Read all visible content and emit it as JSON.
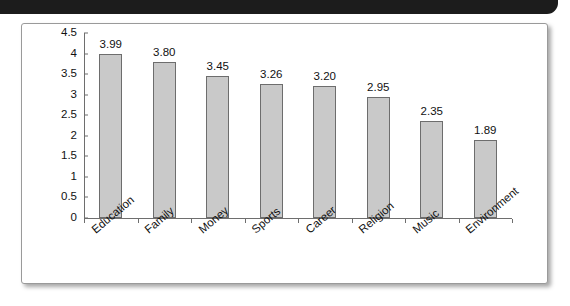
{
  "banner": {
    "name": "top-black-banner"
  },
  "chart_data": {
    "type": "bar",
    "title": "",
    "subtitle": "",
    "xlabel": "",
    "ylabel": "",
    "categories": [
      "Education",
      "Family",
      "Money",
      "Sports",
      "Career",
      "Religion",
      "Music",
      "Environment"
    ],
    "values": [
      3.99,
      3.8,
      3.45,
      3.26,
      3.2,
      2.95,
      2.35,
      1.89
    ],
    "value_labels": [
      "3.99",
      "3.80",
      "3.45",
      "3.26",
      "3.20",
      "2.95",
      "2.35",
      "1.89"
    ],
    "ylim": [
      0,
      4.5
    ],
    "ytick_labels": [
      "4.5",
      "4",
      "3.5",
      "3",
      "2.5",
      "2",
      "1.5",
      "1",
      "0.5",
      "0"
    ],
    "ytick_values": [
      4.5,
      4,
      3.5,
      3,
      2.5,
      2,
      1.5,
      1,
      0.5,
      0
    ],
    "grid": false,
    "legend": "none",
    "bar_color": "#c9c9c9",
    "bar_edge_color": "#6d6d6d",
    "axis_color": "#6e6e6e",
    "text_color": "#111111",
    "background": "#ffffff",
    "label_rotation_deg": -40
  }
}
